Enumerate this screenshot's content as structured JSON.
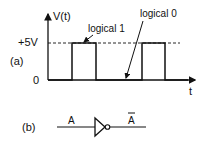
{
  "figure_a": {
    "panel_label": "(a)",
    "y_axis_label": "V(t)",
    "x_axis_label": "t",
    "y_ticks": [
      "+5V",
      "0"
    ],
    "annotations": {
      "high": "logical 1",
      "low": "logical 0"
    },
    "signal": {
      "type": "square-wave",
      "levels": [
        "0",
        "+5V"
      ],
      "pulses": 2
    }
  },
  "figure_b": {
    "panel_label": "(b)",
    "input_label": "A",
    "output_label": "A",
    "output_overbar": true,
    "gate": "NOT"
  }
}
